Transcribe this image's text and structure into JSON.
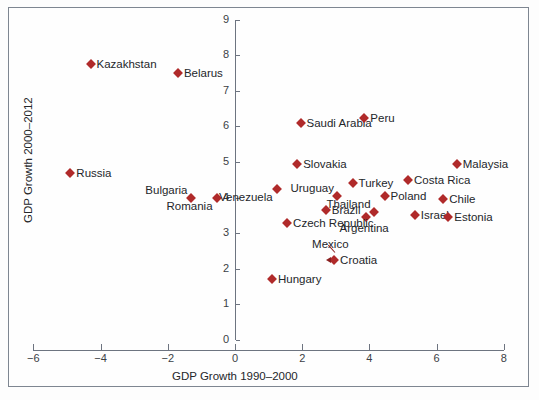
{
  "chart_data": {
    "type": "scatter",
    "title": "",
    "xlabel": "GDP Growth 1990–2000",
    "ylabel": "GDP Growth 2000–2012",
    "xlim": [
      -6,
      8
    ],
    "ylim": [
      0,
      9
    ],
    "xticks": [
      "−6",
      "−4",
      "−2",
      "0",
      "2",
      "4",
      "6",
      "8"
    ],
    "xtick_values": [
      -6,
      -4,
      -2,
      0,
      2,
      4,
      6,
      8
    ],
    "yticks": [
      "0",
      "1",
      "2",
      "3",
      "4",
      "5",
      "6",
      "7",
      "8",
      "9"
    ],
    "ytick_values": [
      0,
      1,
      2,
      3,
      4,
      5,
      6,
      7,
      8,
      9
    ],
    "grid": false,
    "legend": null,
    "marker": "diamond",
    "marker_color": "#b02a2a",
    "points": [
      {
        "label": "Kazakhstan",
        "x": -4.3,
        "y": 7.75,
        "label_pos": "right"
      },
      {
        "label": "Belarus",
        "x": -1.7,
        "y": 7.5,
        "label_pos": "right"
      },
      {
        "label": "Russia",
        "x": -4.9,
        "y": 4.7,
        "label_pos": "right"
      },
      {
        "label": "Bulgaria",
        "x": -1.3,
        "y": 4.0,
        "label_pos": "above-left"
      },
      {
        "label": "Romania",
        "x": -0.55,
        "y": 4.0,
        "label_pos": "below-left"
      },
      {
        "label": "Saudi Arabia",
        "x": 1.95,
        "y": 6.1,
        "label_pos": "right"
      },
      {
        "label": "Peru",
        "x": 3.85,
        "y": 6.25,
        "label_pos": "right"
      },
      {
        "label": "Slovakia",
        "x": 1.85,
        "y": 4.95,
        "label_pos": "right"
      },
      {
        "label": "Malaysia",
        "x": 6.6,
        "y": 4.95,
        "label_pos": "right"
      },
      {
        "label": "Costa Rica",
        "x": 5.15,
        "y": 4.5,
        "label_pos": "right"
      },
      {
        "label": "Turkey",
        "x": 3.5,
        "y": 4.4,
        "label_pos": "right"
      },
      {
        "label": "Venezuela",
        "x": 1.25,
        "y": 4.25,
        "label_pos": "below-left"
      },
      {
        "label": "Uruguay",
        "x": 3.05,
        "y": 4.05,
        "label_pos": "above-left"
      },
      {
        "label": "Poland",
        "x": 4.45,
        "y": 4.05,
        "label_pos": "right"
      },
      {
        "label": "Chile",
        "x": 6.2,
        "y": 3.95,
        "label_pos": "right"
      },
      {
        "label": "Thailand",
        "x": 4.15,
        "y": 3.6,
        "label_pos": "above-left"
      },
      {
        "label": "Brazil",
        "x": 2.7,
        "y": 3.65,
        "label_pos": "right"
      },
      {
        "label": "Israel",
        "x": 5.35,
        "y": 3.5,
        "label_pos": "right"
      },
      {
        "label": "Estonia",
        "x": 6.35,
        "y": 3.45,
        "label_pos": "right"
      },
      {
        "label": "Argentina",
        "x": 3.9,
        "y": 3.45,
        "label_pos": "below-right"
      },
      {
        "label": "Czech Republic",
        "x": 1.55,
        "y": 3.3,
        "label_pos": "right"
      },
      {
        "label": "Croatia",
        "x": 2.95,
        "y": 2.25,
        "label_pos": "right"
      },
      {
        "label": "Mexico",
        "x": 2.95,
        "y": 2.25,
        "label_pos": "leader-above"
      },
      {
        "label": "Hungary",
        "x": 1.1,
        "y": 1.7,
        "label_pos": "right"
      }
    ]
  },
  "axis": {
    "x_title": "GDP Growth 1990–2000",
    "y_title": "GDP Growth 2000–2012"
  }
}
